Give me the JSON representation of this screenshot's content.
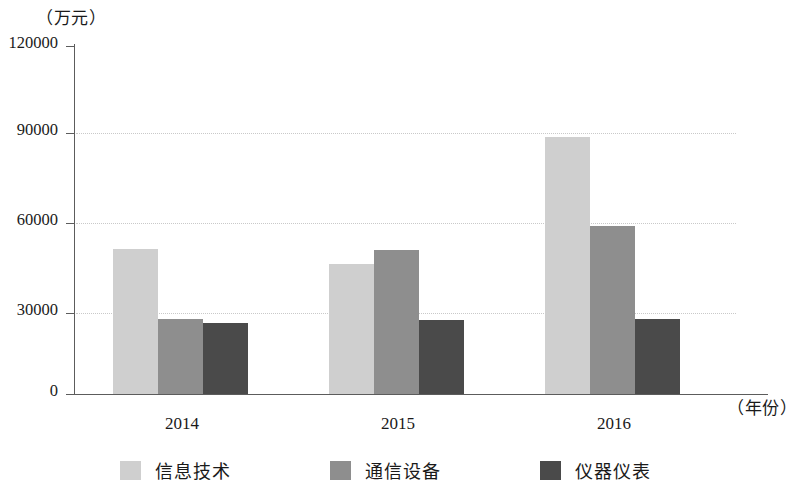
{
  "chart_data": {
    "type": "bar",
    "title": "",
    "subtitle": "",
    "xlabel": "（年份）",
    "ylabel": "（万元）",
    "categories": [
      "2014",
      "2015",
      "2016"
    ],
    "series": [
      {
        "name": "信息技术",
        "color": "#cfcfcf",
        "values": [
          50000,
          45000,
          88500
        ]
      },
      {
        "name": "通信设备",
        "color": "#8e8e8e",
        "values": [
          26000,
          49500,
          58000
        ]
      },
      {
        "name": "仪器仪表",
        "color": "#4a4a4a",
        "values": [
          24500,
          25500,
          26000
        ]
      }
    ],
    "ylim": [
      0,
      120000
    ],
    "ytick_labels": [
      "0",
      "30000",
      "60000",
      "90000",
      "120000"
    ],
    "ytick_values": [
      0,
      30000,
      60000,
      90000,
      120000
    ],
    "grid": true,
    "grid_style": "dotted-horizontal",
    "legend_position": "bottom"
  },
  "axis": {
    "unit_caption": "（万元）",
    "year_caption": "（年份）",
    "ticks": [
      {
        "label": "120000"
      },
      {
        "label": "90000"
      },
      {
        "label": "60000"
      },
      {
        "label": "30000"
      },
      {
        "label": "0"
      }
    ]
  },
  "xlabels": [
    {
      "label": "2014"
    },
    {
      "label": "2015"
    },
    {
      "label": "2016"
    }
  ],
  "legend": {
    "items": [
      {
        "label": "信息技术"
      },
      {
        "label": "通信设备"
      },
      {
        "label": "仪器仪表"
      }
    ]
  }
}
